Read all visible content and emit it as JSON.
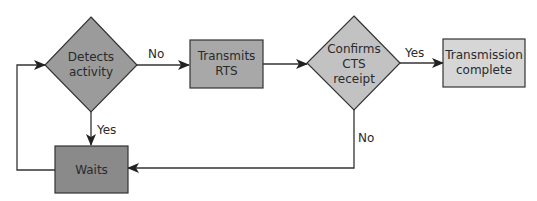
{
  "diagram": {
    "type": "flowchart",
    "nodes": {
      "detects": {
        "shape": "diamond",
        "line1": "Detects",
        "line2": "activity",
        "fill": "#9b9b9b"
      },
      "rts": {
        "shape": "rect",
        "line1": "Transmits",
        "line2": "RTS",
        "fill": "#a8a8a8"
      },
      "confirms": {
        "shape": "diamond",
        "line1": "Confirms",
        "line2": "CTS",
        "line3": "receipt",
        "fill": "#c2c2c2"
      },
      "complete": {
        "shape": "rect",
        "line1": "Transmission",
        "line2": "complete",
        "fill": "#d6d6d6"
      },
      "waits": {
        "shape": "rect",
        "line1": "Waits",
        "fill": "#8a8a8a"
      }
    },
    "edges": {
      "detects_to_rts": {
        "label": "No"
      },
      "detects_to_waits": {
        "label": "Yes"
      },
      "rts_to_confirms": {
        "label": ""
      },
      "confirms_to_complete": {
        "label": "Yes"
      },
      "confirms_to_waits": {
        "label": "No"
      },
      "waits_to_detects": {
        "label": ""
      }
    }
  }
}
